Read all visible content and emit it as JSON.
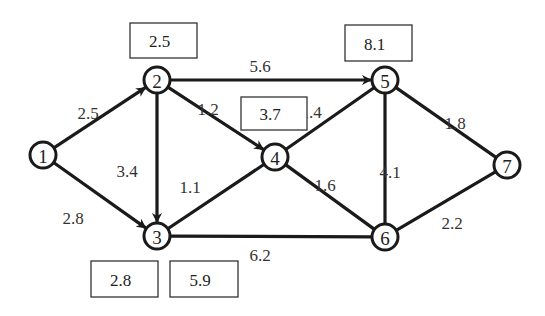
{
  "diagram": {
    "type": "directed-network",
    "nodes": [
      {
        "id": "1",
        "x": 43,
        "y": 155
      },
      {
        "id": "2",
        "x": 157,
        "y": 80
      },
      {
        "id": "3",
        "x": 157,
        "y": 236
      },
      {
        "id": "4",
        "x": 275,
        "y": 157
      },
      {
        "id": "5",
        "x": 385,
        "y": 80
      },
      {
        "id": "6",
        "x": 385,
        "y": 237
      },
      {
        "id": "7",
        "x": 507,
        "y": 165
      }
    ],
    "edges": [
      {
        "from": "1",
        "to": "2",
        "weight": "2.5",
        "arrow": true,
        "lx": 88,
        "ly": 113
      },
      {
        "from": "1",
        "to": "3",
        "weight": "2.8",
        "arrow": true,
        "lx": 73,
        "ly": 218
      },
      {
        "from": "2",
        "to": "5",
        "weight": "5.6",
        "arrow": true,
        "lx": 260,
        "ly": 66
      },
      {
        "from": "2",
        "to": "4",
        "weight": "1.2",
        "arrow": true,
        "lx": 208,
        "ly": 109
      },
      {
        "from": "2",
        "to": "3",
        "weight": "3.4",
        "arrow": true,
        "lx": 127,
        "ly": 171
      },
      {
        "from": "3",
        "to": "4",
        "weight": "1.1",
        "arrow": false,
        "lx": 190,
        "ly": 187
      },
      {
        "from": "4",
        "to": "5",
        "weight": "1.4",
        "arrow": false,
        "lx": 311,
        "ly": 112
      },
      {
        "from": "4",
        "to": "6",
        "weight": "1.6",
        "arrow": false,
        "lx": 325,
        "ly": 185
      },
      {
        "from": "3",
        "to": "6",
        "weight": "6.2",
        "arrow": false,
        "lx": 260,
        "ly": 255
      },
      {
        "from": "5",
        "to": "6",
        "weight": "4.1",
        "arrow": false,
        "lx": 390,
        "ly": 172
      },
      {
        "from": "5",
        "to": "7",
        "weight": "1.8",
        "arrow": false,
        "lx": 455,
        "ly": 123
      },
      {
        "from": "6",
        "to": "7",
        "weight": "2.2",
        "arrow": false,
        "lx": 452,
        "ly": 223
      }
    ],
    "boxes": [
      {
        "label": "2.5",
        "x": 130,
        "y": 23,
        "w": 67,
        "h": 35
      },
      {
        "label": "8.1",
        "x": 345,
        "y": 25,
        "w": 67,
        "h": 36
      },
      {
        "label": "3.7",
        "x": 241,
        "y": 97,
        "w": 66,
        "h": 33
      },
      {
        "label": "2.8",
        "x": 91,
        "y": 261,
        "w": 67,
        "h": 36
      },
      {
        "label": "5.9",
        "x": 170,
        "y": 261,
        "w": 68,
        "h": 36
      }
    ],
    "colors": {
      "stroke": "#1a1a1a",
      "background": "#ffffff"
    }
  }
}
